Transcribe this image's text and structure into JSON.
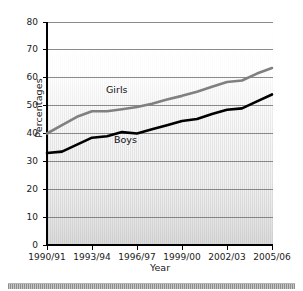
{
  "chart_data": {
    "type": "line",
    "title": "",
    "xlabel": "Year",
    "ylabel": "Percentages",
    "ylim": [
      0,
      80
    ],
    "yticks": [
      0,
      10,
      20,
      30,
      40,
      50,
      60,
      70,
      80
    ],
    "ytick_labels": [
      "0",
      "10",
      "20",
      "30",
      "40",
      "50",
      "60",
      "70",
      "80"
    ],
    "grid": true,
    "legend_position": "inline-labels",
    "x": [
      "1990/91",
      "1991/92",
      "1992/93",
      "1993/94",
      "1994/95",
      "1995/96",
      "1996/97",
      "1997/98",
      "1998/99",
      "1999/00",
      "2000/01",
      "2001/02",
      "2002/03",
      "2003/04",
      "2004/05",
      "2005/06"
    ],
    "xtick_labels": [
      "1990/91",
      "1993/94",
      "1996/97",
      "1999/00",
      "2002/03",
      "2005/06"
    ],
    "xtick_indices": [
      0,
      3,
      6,
      9,
      12,
      15
    ],
    "series": [
      {
        "name": "Girls",
        "color": "#808080",
        "values": [
          40.0,
          43.0,
          46.0,
          48.0,
          48.0,
          48.7,
          49.5,
          50.7,
          52.2,
          53.5,
          55.0,
          56.8,
          58.5,
          59.0,
          61.5,
          63.5
        ]
      },
      {
        "name": "Boys",
        "color": "#000000",
        "values": [
          33.0,
          33.5,
          36.0,
          38.5,
          39.0,
          40.5,
          40.0,
          41.5,
          43.0,
          44.5,
          45.2,
          47.0,
          48.5,
          49.0,
          51.5,
          54.0
        ]
      }
    ]
  },
  "axes": {
    "y_title": "Percentages",
    "x_title": "Year"
  }
}
